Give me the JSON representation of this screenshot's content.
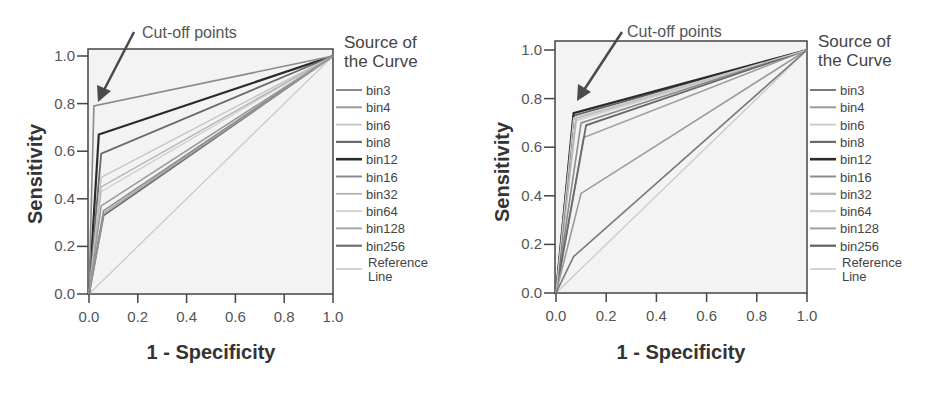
{
  "chart_data": [
    {
      "type": "line",
      "subtype": "roc",
      "title": "",
      "xlabel": "1 - Specificity",
      "ylabel": "Sensitivity",
      "xlim": [
        0,
        1
      ],
      "ylim": [
        0,
        1
      ],
      "xticks": [
        "0.0",
        "0.2",
        "0.4",
        "0.6",
        "0.8",
        "1.0"
      ],
      "yticks": [
        "0.0",
        "0.2",
        "0.4",
        "0.6",
        "0.8",
        "1.0"
      ],
      "grid": false,
      "legend_title": [
        "Source of",
        "the Curve"
      ],
      "legend_position": "right",
      "annotation": "Cut-off points",
      "series": [
        {
          "name": "bin3",
          "color": "#8a8a8a",
          "width": 1.6,
          "x": [
            0,
            0.02,
            1
          ],
          "y": [
            0,
            0.79,
            1
          ]
        },
        {
          "name": "bin4",
          "color": "#9a9a9a",
          "width": 1.6,
          "x": [
            0,
            0.05,
            1
          ],
          "y": [
            0,
            0.37,
            1
          ]
        },
        {
          "name": "bin6",
          "color": "#c4c4c4",
          "width": 1.4,
          "x": [
            0,
            0.05,
            1
          ],
          "y": [
            0,
            0.49,
            1
          ]
        },
        {
          "name": "bin8",
          "color": "#6a6a6a",
          "width": 1.8,
          "x": [
            0,
            0.05,
            1
          ],
          "y": [
            0,
            0.59,
            1
          ]
        },
        {
          "name": "bin12",
          "color": "#2a2a2a",
          "width": 2.2,
          "x": [
            0,
            0.04,
            1
          ],
          "y": [
            0,
            0.67,
            1
          ]
        },
        {
          "name": "bin16",
          "color": "#8c8c8c",
          "width": 1.6,
          "x": [
            0,
            0.06,
            1
          ],
          "y": [
            0,
            0.35,
            1
          ]
        },
        {
          "name": "bin32",
          "color": "#b4b4b4",
          "width": 1.4,
          "x": [
            0,
            0.05,
            1
          ],
          "y": [
            0,
            0.45,
            1
          ]
        },
        {
          "name": "bin64",
          "color": "#d0d0d0",
          "width": 1.4,
          "x": [
            0,
            0.05,
            1
          ],
          "y": [
            0,
            0.43,
            1
          ]
        },
        {
          "name": "bin128",
          "color": "#a8a8a8",
          "width": 1.6,
          "x": [
            0,
            0.06,
            1
          ],
          "y": [
            0,
            0.34,
            1
          ]
        },
        {
          "name": "bin256",
          "color": "#707070",
          "width": 1.8,
          "x": [
            0,
            0.06,
            1
          ],
          "y": [
            0,
            0.33,
            1
          ]
        },
        {
          "name": "Reference Line",
          "color": "#c8c8c8",
          "width": 1.2,
          "x": [
            0,
            1
          ],
          "y": [
            0,
            1
          ]
        }
      ]
    },
    {
      "type": "line",
      "subtype": "roc",
      "title": "",
      "xlabel": "1 - Specificity",
      "ylabel": "Sensitivity",
      "xlim": [
        0,
        1
      ],
      "ylim": [
        0,
        1
      ],
      "xticks": [
        "0.0",
        "0.2",
        "0.4",
        "0.6",
        "0.8",
        "1.0"
      ],
      "yticks": [
        "0.0",
        "0.2",
        "0.4",
        "0.6",
        "0.8",
        "1.0"
      ],
      "grid": false,
      "legend_title": [
        "Source of",
        "the Curve"
      ],
      "legend_position": "right",
      "annotation": "Cut-off points",
      "series": [
        {
          "name": "bin3",
          "color": "#7a7a7a",
          "width": 1.6,
          "x": [
            0,
            0.07,
            1
          ],
          "y": [
            0,
            0.15,
            1
          ]
        },
        {
          "name": "bin4",
          "color": "#9a9a9a",
          "width": 1.6,
          "x": [
            0,
            0.1,
            1
          ],
          "y": [
            0,
            0.41,
            1
          ]
        },
        {
          "name": "bin6",
          "color": "#c8c8c8",
          "width": 1.4,
          "x": [
            0,
            0.07,
            1
          ],
          "y": [
            0,
            0.72,
            1
          ]
        },
        {
          "name": "bin8",
          "color": "#6a6a6a",
          "width": 1.8,
          "x": [
            0,
            0.12,
            1
          ],
          "y": [
            0,
            0.69,
            1
          ]
        },
        {
          "name": "bin12",
          "color": "#2a2a2a",
          "width": 2.2,
          "x": [
            0,
            0.07,
            1
          ],
          "y": [
            0,
            0.74,
            1
          ]
        },
        {
          "name": "bin16",
          "color": "#8c8c8c",
          "width": 1.6,
          "x": [
            0,
            0.1,
            1
          ],
          "y": [
            0,
            0.7,
            1
          ]
        },
        {
          "name": "bin32",
          "color": "#b8b8b8",
          "width": 2.0,
          "x": [
            0,
            0.08,
            1
          ],
          "y": [
            0,
            0.72,
            1
          ]
        },
        {
          "name": "bin64",
          "color": "#d2d2d2",
          "width": 2.0,
          "x": [
            0,
            0.08,
            1
          ],
          "y": [
            0,
            0.71,
            1
          ]
        },
        {
          "name": "bin128",
          "color": "#a0a0a0",
          "width": 1.6,
          "x": [
            0,
            0.11,
            1
          ],
          "y": [
            0,
            0.64,
            1
          ]
        },
        {
          "name": "bin256",
          "color": "#606060",
          "width": 1.8,
          "x": [
            0,
            0.07,
            1
          ],
          "y": [
            0,
            0.73,
            1
          ]
        },
        {
          "name": "Reference Line",
          "color": "#c8c8c8",
          "width": 1.2,
          "x": [
            0,
            1
          ],
          "y": [
            0,
            1
          ]
        }
      ]
    }
  ],
  "charts": [
    {
      "annotation": "Cut-off points",
      "xlabel": "1 - Specificity",
      "ylabel": "Sensitivity",
      "legend_title_1": "Source of",
      "legend_title_2": "the Curve",
      "legend": [
        "bin3",
        "bin4",
        "bin6",
        "bin8",
        "bin12",
        "bin16",
        "bin32",
        "bin64",
        "bin128",
        "bin256"
      ],
      "legend_ref_1": "Reference",
      "legend_ref_2": "Line",
      "xticks": [
        "0.0",
        "0.2",
        "0.4",
        "0.6",
        "0.8",
        "1.0"
      ],
      "yticks": [
        "0.0",
        "0.2",
        "0.4",
        "0.6",
        "0.8",
        "1.0"
      ]
    },
    {
      "annotation": "Cut-off points",
      "xlabel": "1 - Specificity",
      "ylabel": "Sensitivity",
      "legend_title_1": "Source of",
      "legend_title_2": "the Curve",
      "legend": [
        "bin3",
        "bin4",
        "bin6",
        "bin8",
        "bin12",
        "bin16",
        "bin32",
        "bin64",
        "bin128",
        "bin256"
      ],
      "legend_ref_1": "Reference",
      "legend_ref_2": "Line",
      "xticks": [
        "0.0",
        "0.2",
        "0.4",
        "0.6",
        "0.8",
        "1.0"
      ],
      "yticks": [
        "0.0",
        "0.2",
        "0.4",
        "0.6",
        "0.8",
        "1.0"
      ]
    }
  ],
  "colors": {
    "plot_bg": "#f3f3f3",
    "frame": "#444444",
    "arrow": "#4a4a4a"
  }
}
